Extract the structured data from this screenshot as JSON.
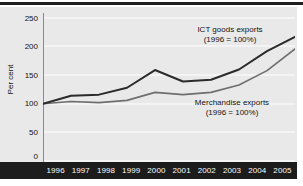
{
  "chart_data": {
    "type": "line",
    "title": "",
    "xlabel": "",
    "ylabel": "Per cent",
    "categories": [
      "1996",
      "1997",
      "1998",
      "1999",
      "2000",
      "2001",
      "2002",
      "2003",
      "2004",
      "2005"
    ],
    "x": [
      1996,
      1997,
      1998,
      1999,
      2000,
      2001,
      2002,
      2003,
      2004,
      2005
    ],
    "ylim": [
      0,
      250
    ],
    "xlim": [
      1996,
      2005
    ],
    "yticks": [
      250,
      200,
      150,
      100,
      50,
      0
    ],
    "grid": true,
    "legend": "annotations-inline",
    "series": [
      {
        "name": "ICT goods exports",
        "note": "(1996 = 100%)",
        "color": "#2b2b2b",
        "values": [
          100,
          114,
          116,
          128,
          159,
          139,
          142,
          160,
          192,
          217
        ]
      },
      {
        "name": "Merchandise exports",
        "note": "(1996 = 100%)",
        "color": "#6e6e6e",
        "values": [
          100,
          104,
          102,
          106,
          120,
          116,
          120,
          133,
          158,
          196
        ]
      }
    ],
    "annotations": [
      {
        "id": "ict",
        "line1": "ICT goods exports",
        "line2": "(1996 = 100%)"
      },
      {
        "id": "merchandise",
        "line1": "Merchandise exports",
        "line2": "(1996 = 100%)"
      }
    ]
  },
  "axis": {
    "y_title": "Per cent",
    "y_tick_labels": [
      "250",
      "200",
      "150",
      "100",
      "50",
      "0"
    ],
    "x_tick_labels": [
      "1996",
      "1997",
      "1998",
      "1999",
      "2000",
      "2001",
      "2002",
      "2003",
      "2004",
      "2005"
    ]
  },
  "colors": {
    "panel_background": "#e9e9e9",
    "gridline": "#ffffff",
    "axis_band": "#1c1c1c",
    "series_ict": "#2b2b2b",
    "series_merchandise": "#6e6e6e",
    "text": "#111111",
    "band_text": "#ffffff"
  }
}
